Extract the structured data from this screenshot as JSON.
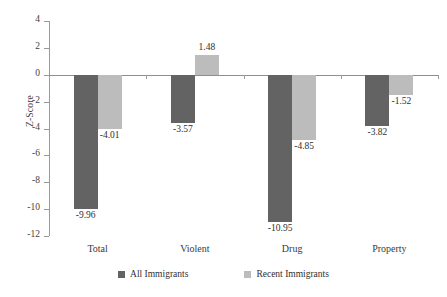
{
  "chart_data": {
    "type": "bar",
    "title": "",
    "xlabel": "",
    "ylabel": "Z-Score",
    "categories": [
      "Total",
      "Violent",
      "Drug",
      "Property"
    ],
    "ylim": [
      -12,
      4
    ],
    "yticks": [
      4,
      2,
      0,
      -2,
      -4,
      -6,
      -8,
      -10,
      -12
    ],
    "ytick_labels": [
      "4",
      "2",
      "0",
      "-2",
      "-4",
      "-6",
      "-8",
      "-10",
      "-12"
    ],
    "grid": false,
    "legend_position": "bottom",
    "series": [
      {
        "name": "All Immigrants",
        "color": "#636363",
        "values": [
          -9.96,
          -3.57,
          -10.95,
          -3.82
        ],
        "labels": [
          "-9.96",
          "-3.57",
          "-10.95",
          "-3.82"
        ]
      },
      {
        "name": "Recent Immigrants",
        "color": "#bcbcbc",
        "values": [
          -4.01,
          1.48,
          -4.85,
          -1.52
        ],
        "labels": [
          "-4.01",
          "1.48",
          "-4.85",
          "-1.52"
        ]
      }
    ]
  },
  "axis": {
    "line_color": "#9a9a9a",
    "zero_line_color": "#8f8f8f"
  },
  "legend": {
    "items": [
      {
        "label": "All Immigrants",
        "color": "#636363"
      },
      {
        "label": "Recent Immigrants",
        "color": "#bcbcbc"
      }
    ]
  }
}
